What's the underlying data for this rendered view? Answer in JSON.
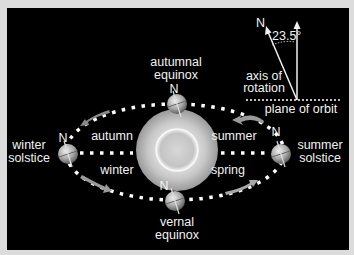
{
  "diagram": {
    "colors": {
      "background": "#000000",
      "border": "#dcdcdc",
      "text": "#f2f2f2",
      "orbit_dots": "#ffffff",
      "arrow": "#9a9a9a"
    },
    "sun": {
      "label": ""
    },
    "positions": [
      {
        "id": "autumnal",
        "line1": "autumnal",
        "line2": "equinox",
        "north": "N"
      },
      {
        "id": "winter",
        "line1": "winter",
        "line2": "solstice",
        "north": "N"
      },
      {
        "id": "summer",
        "line1": "summer",
        "line2": "solstice",
        "north": "N"
      },
      {
        "id": "vernal",
        "line1": "vernal",
        "line2": "equinox",
        "north": "N"
      }
    ],
    "seasons": {
      "autumn": "autumn",
      "winter": "winter",
      "summer": "summer",
      "spring": "spring"
    },
    "inset": {
      "north": "N",
      "angle": "23.5°",
      "axis_label_1": "axis of",
      "axis_label_2": "rotation",
      "plane_label": "plane of orbit"
    }
  }
}
